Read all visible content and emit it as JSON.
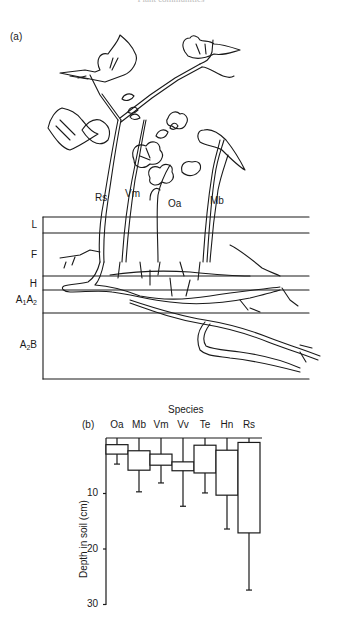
{
  "caption": "Plant communities",
  "panel_a": {
    "label": "(a)",
    "species_labels": [
      {
        "code": "Rs",
        "x": 95,
        "y": 192
      },
      {
        "code": "Vm",
        "x": 125,
        "y": 188
      },
      {
        "code": "Oa",
        "x": 168,
        "y": 198
      },
      {
        "code": "Mb",
        "x": 210,
        "y": 195
      }
    ],
    "soil_layers": [
      {
        "name": "L",
        "html": "L"
      },
      {
        "name": "F",
        "html": "F"
      },
      {
        "name": "H",
        "html": "H"
      },
      {
        "name": "A1A2",
        "main": "A",
        "sub1": "1",
        "main2": "A",
        "sub2": "2"
      },
      {
        "name": "A2B",
        "main": "A",
        "sub1": "2",
        "main2": "B"
      }
    ]
  },
  "panel_b": {
    "label": "(b)",
    "x_title": "Species",
    "y_title": "Depth in soil (cm)",
    "y_ticks": [
      "10",
      "20",
      "30"
    ]
  },
  "chart_data": {
    "type": "boxplot",
    "title": "",
    "xlabel": "Species",
    "ylabel": "Depth in soil (cm)",
    "ylim": [
      0,
      30
    ],
    "y_inverted": true,
    "y_ticks": [
      10,
      20,
      30
    ],
    "categories": [
      "Oa",
      "Mb",
      "Vm",
      "Vv",
      "Te",
      "Hn",
      "Rs"
    ],
    "series": [
      {
        "name": "Oa",
        "whisker_top": 0,
        "box_top": 1.2,
        "box_bottom": 2.9,
        "whisker_bottom": 4.7
      },
      {
        "name": "Mb",
        "whisker_top": 0,
        "box_top": 2.3,
        "box_bottom": 5.8,
        "whisker_bottom": 9.7
      },
      {
        "name": "Vm",
        "whisker_top": 0,
        "box_top": 2.9,
        "box_bottom": 4.9,
        "whisker_bottom": 8.1
      },
      {
        "name": "Vv",
        "whisker_top": 0,
        "box_top": 4.3,
        "box_bottom": 5.9,
        "whisker_bottom": 12.3
      },
      {
        "name": "Te",
        "whisker_top": 0,
        "box_top": 1.3,
        "box_bottom": 6.3,
        "whisker_bottom": 9.9
      },
      {
        "name": "Hn",
        "whisker_top": 0,
        "box_top": 2.2,
        "box_bottom": 10.3,
        "whisker_bottom": 16.4
      },
      {
        "name": "Rs",
        "whisker_top": 0,
        "box_top": 0.8,
        "box_bottom": 17.1,
        "whisker_bottom": 27.4
      }
    ],
    "grid": false,
    "legend": "none"
  }
}
